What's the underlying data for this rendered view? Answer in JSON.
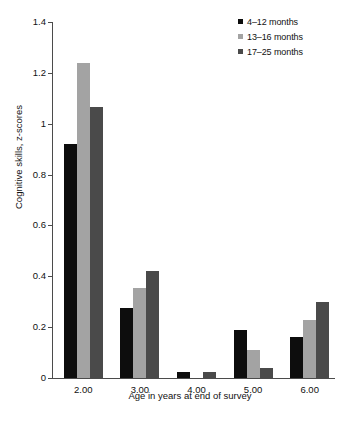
{
  "chart_data": {
    "type": "bar",
    "title": "",
    "xlabel": "Age in years at end of survey",
    "ylabel": "Cognitive skills, z-scores",
    "categories": [
      "2.00",
      "3.00",
      "4.00",
      "5.00",
      "6.00"
    ],
    "series": [
      {
        "name": "4–12 months",
        "color": "#0d0d0d",
        "values": [
          0.92,
          0.275,
          0.025,
          0.19,
          0.16
        ]
      },
      {
        "name": "13–16 months",
        "color": "#a3a3a3",
        "values": [
          1.24,
          0.355,
          0.0,
          0.11,
          0.23
        ]
      },
      {
        "name": "17–25 months",
        "color": "#4a4a4a",
        "values": [
          1.065,
          0.42,
          0.025,
          0.04,
          0.3
        ]
      }
    ],
    "ylim": [
      0,
      1.4
    ],
    "yticks": [
      0,
      0.2,
      0.4,
      0.6,
      0.8,
      1,
      1.2,
      1.4
    ],
    "ytick_labels": [
      "0",
      "0.2",
      "0.4",
      "0.6",
      "0.8",
      "1",
      "1.2",
      "1.4"
    ],
    "grid": false,
    "legend_position": "top-right"
  }
}
